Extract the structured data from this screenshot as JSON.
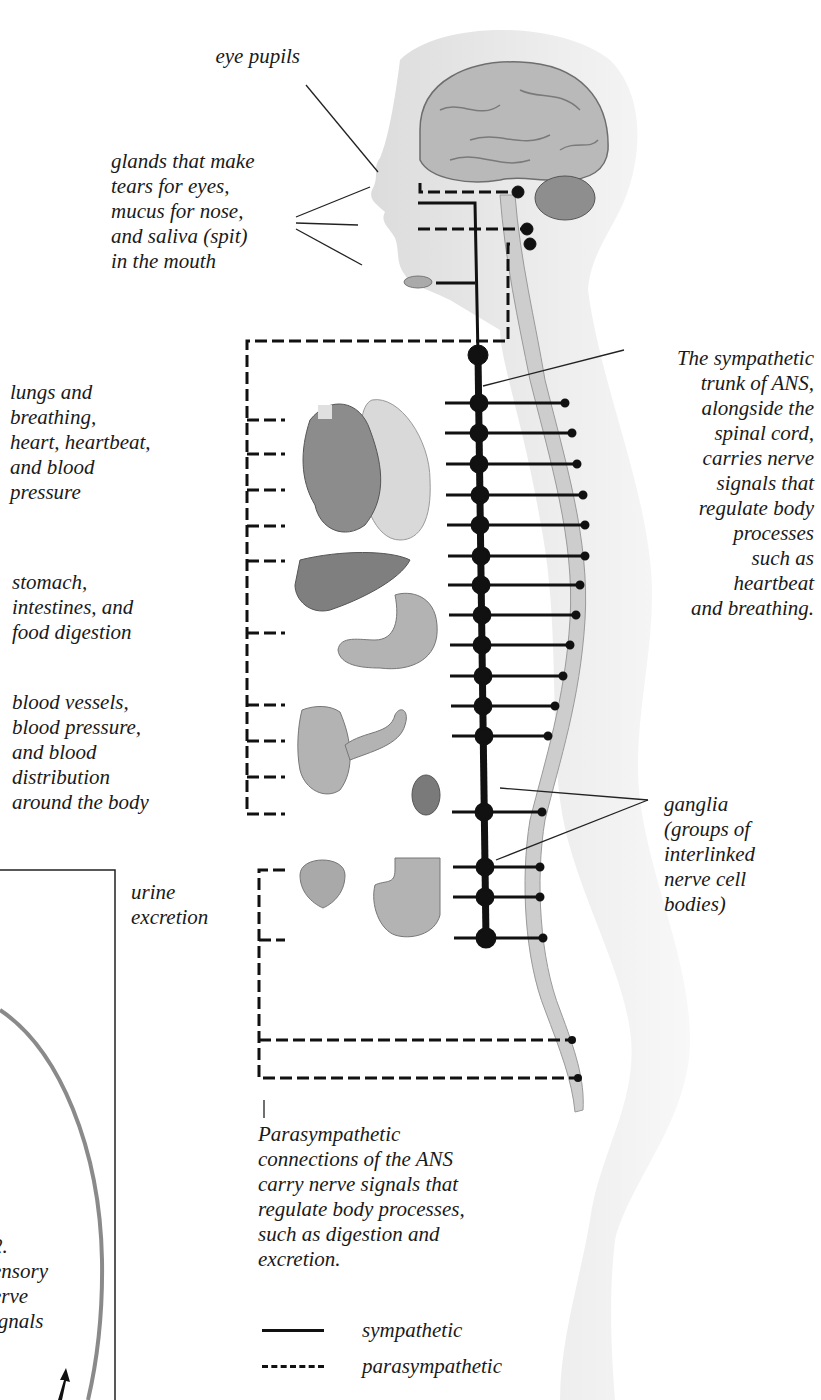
{
  "labels": {
    "eye_pupils": "eye pupils",
    "glands": "glands that make\ntears for eyes,\nmucus for nose,\nand saliva (spit)\nin the mouth",
    "lungs_heart": "lungs and\nbreathing,\nheart, heartbeat,\nand blood\npressure",
    "digestion": "stomach,\nintestines, and\nfood digestion",
    "blood_vessels": "blood vessels,\nblood pressure,\nand blood\ndistribution\naround the body",
    "urine": "urine\nexcretion",
    "sympathetic_trunk": "The sympathetic\ntrunk of ANS,\nalongside the\nspinal cord,\ncarries nerve\nsignals that\nregulate body\nprocesses\nsuch as\nheartbeat\nand breathing.",
    "ganglia": "ganglia\n(groups of\ninterlinked\nnerve cell\nbodies)",
    "parasympathetic": "Parasympathetic\nconnections of the ANS\ncarry nerve signals that\nregulate body processes,\nsuch as digestion and\nexcretion.",
    "side_panel": "2.\nensory\nerve\nignals"
  },
  "legend": {
    "items": [
      {
        "style": "solid",
        "label": "sympathetic"
      },
      {
        "style": "dashed",
        "label": "parasympathetic"
      }
    ]
  },
  "colors": {
    "line": "#111111",
    "body_fill": "#e6e6e6",
    "spine_fill": "#cfcfcf",
    "organ_fill": "#9a9a9a",
    "brain_fill": "#b8b8b8"
  },
  "structure": {
    "ganglia_count": 16,
    "organs": [
      "brain",
      "cerebellum",
      "salivary-gland",
      "heart",
      "lung",
      "liver",
      "stomach",
      "pancreas",
      "large-intestine",
      "kidney",
      "bladder",
      "rectum"
    ]
  }
}
